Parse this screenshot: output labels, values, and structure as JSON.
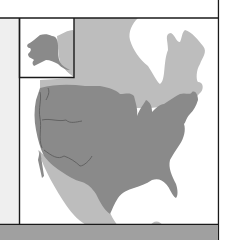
{
  "map": {
    "kind": "range-map",
    "region": "North America",
    "inset": "Alaska",
    "colors": {
      "page_background": "#ffffff",
      "left_margin": "#efefef",
      "bottom_band": "#a0a0a0",
      "frame_line": "#1a1a1a",
      "water_background": "#ffffff",
      "secondary_range": "#bdbdbd",
      "primary_range": "#8a8a8a",
      "rivers": "#5e5e5e"
    },
    "legend": [],
    "labels": []
  }
}
